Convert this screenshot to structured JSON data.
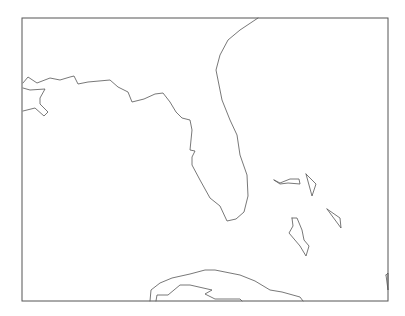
{
  "map": {
    "width": 405,
    "height": 316,
    "background": "#ffffff",
    "frame": {
      "x": 22,
      "y": 18,
      "width": 366,
      "height": 283,
      "stroke": "#555555"
    },
    "coast_color": "#555555",
    "features": [
      {
        "name": "florida-gulf-and-atlantic-coast",
        "points": "23,83 28,77 37,83 50,78 60,80 70,77 74,76 78,84 88,82 110,80 118,87 128,92 132,102 144,99 155,94 163,93 170,102 176,112 182,118 190,120 192,130 190,150 195,151 192,157 192,165 200,180 210,198 220,206 227,221 236,219 244,212 248,196 247,175 240,155 237,135 230,120 222,100 218,80 216,70 220,55 228,40 240,30 252,22 258,18"
      },
      {
        "name": "gulf-coast-bay-inlet",
        "points": "23,88 30,90 45,89 40,98 40,104 48,112 44,116 35,108 23,111"
      },
      {
        "name": "bahamas-grand-bahama",
        "points": "274,180 280,183 290,179 299,179 300,184 288,183 280,184 274,180"
      },
      {
        "name": "bahamas-abaco",
        "points": "306,174 316,184 312,196 306,174"
      },
      {
        "name": "bahamas-eleuthera",
        "points": "327,209 340,218 341,228 327,209"
      },
      {
        "name": "bahamas-andros",
        "points": "292,218 297,218 302,230 304,240 309,246 306,256 300,246 289,233 293,226 292,218"
      },
      {
        "name": "cuba-north-coast",
        "points": "150,301 151,290 160,283 172,278 190,274 205,270 215,270 240,275 255,281 270,290 282,292 300,297 303,301"
      },
      {
        "name": "cuba-inner-coast",
        "points": "156,301 157,295 168,295 180,285 190,285 212,290 205,294 215,299 240,299 242,301"
      },
      {
        "name": "hispaniola-edge",
        "points": "386,275 388,273 388,290 386,275"
      }
    ]
  }
}
